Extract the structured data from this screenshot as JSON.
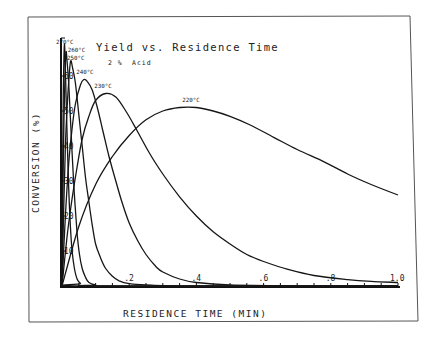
{
  "chart_data": {
    "type": "line",
    "title": "Yield vs. Residence Time",
    "subtitle": "2% Acid",
    "xlabel": "RESIDENCE TIME (MIN)",
    "ylabel": "CONVERSION (%)",
    "xlim": [
      0,
      1.0
    ],
    "ylim": [
      0,
      70
    ],
    "x_ticks": [
      ".2",
      ".4",
      ".6",
      ".8",
      "1.0"
    ],
    "x_tick_values": [
      0.2,
      0.4,
      0.6,
      0.8,
      1.0
    ],
    "y_ticks": [
      "10",
      "20",
      "30",
      "40",
      "50",
      "60"
    ],
    "y_tick_values": [
      10,
      20,
      30,
      40,
      50,
      60
    ],
    "grid": false,
    "legend": "inline curve labels",
    "series": [
      {
        "name": "220°C",
        "label_pos": [
          0.37,
          52.5
        ],
        "points": [
          [
            0,
            0
          ],
          [
            0.05,
            17
          ],
          [
            0.1,
            29
          ],
          [
            0.15,
            37
          ],
          [
            0.2,
            43
          ],
          [
            0.25,
            47.5
          ],
          [
            0.3,
            50
          ],
          [
            0.35,
            51
          ],
          [
            0.4,
            51
          ],
          [
            0.45,
            50
          ],
          [
            0.5,
            48.5
          ],
          [
            0.56,
            46
          ],
          [
            0.63,
            42.5
          ],
          [
            0.7,
            39
          ],
          [
            0.78,
            35.5
          ],
          [
            0.85,
            32
          ],
          [
            0.92,
            29
          ],
          [
            1.0,
            26
          ]
        ]
      },
      {
        "name": "230°C",
        "label_pos": [
          0.12,
          56.5
        ],
        "points": [
          [
            0,
            0
          ],
          [
            0.015,
            14
          ],
          [
            0.03,
            25
          ],
          [
            0.045,
            34
          ],
          [
            0.06,
            42
          ],
          [
            0.08,
            48.5
          ],
          [
            0.1,
            53
          ],
          [
            0.13,
            55
          ],
          [
            0.16,
            54
          ],
          [
            0.19,
            50
          ],
          [
            0.22,
            45
          ],
          [
            0.26,
            38
          ],
          [
            0.3,
            32
          ],
          [
            0.35,
            25.5
          ],
          [
            0.4,
            20
          ],
          [
            0.45,
            15.5
          ],
          [
            0.5,
            12
          ],
          [
            0.55,
            9
          ],
          [
            0.6,
            7
          ],
          [
            0.67,
            4.8
          ],
          [
            0.75,
            3
          ],
          [
            0.85,
            1.8
          ],
          [
            0.92,
            1.3
          ],
          [
            1.0,
            1
          ]
        ]
      },
      {
        "name": "240°C",
        "label_pos": [
          0.06,
          60.5
        ],
        "points": [
          [
            0,
            0
          ],
          [
            0.01,
            20
          ],
          [
            0.02,
            35
          ],
          [
            0.03,
            45
          ],
          [
            0.04,
            52
          ],
          [
            0.055,
            57.5
          ],
          [
            0.065,
            59
          ],
          [
            0.075,
            58.5
          ],
          [
            0.09,
            56
          ],
          [
            0.105,
            51
          ],
          [
            0.12,
            45
          ],
          [
            0.14,
            37
          ],
          [
            0.16,
            30
          ],
          [
            0.18,
            23.5
          ],
          [
            0.2,
            18
          ],
          [
            0.225,
            13
          ],
          [
            0.25,
            9
          ],
          [
            0.28,
            5.5
          ],
          [
            0.3,
            4
          ],
          [
            0.35,
            2
          ],
          [
            0.4,
            1
          ],
          [
            0.5,
            0.3
          ],
          [
            0.7,
            0.05
          ],
          [
            1.0,
            0
          ]
        ]
      },
      {
        "name": "250°C",
        "label_pos": [
          0.015,
          65.5
        ],
        "points": [
          [
            0,
            0
          ],
          [
            0.005,
            22
          ],
          [
            0.01,
            40
          ],
          [
            0.017,
            54
          ],
          [
            0.025,
            64
          ],
          [
            0.032,
            62
          ],
          [
            0.04,
            58
          ],
          [
            0.05,
            49
          ],
          [
            0.06,
            40
          ],
          [
            0.07,
            31
          ],
          [
            0.08,
            24
          ],
          [
            0.09,
            17.5
          ],
          [
            0.1,
            12
          ],
          [
            0.115,
            8
          ],
          [
            0.13,
            5
          ],
          [
            0.15,
            2.8
          ],
          [
            0.17,
            1.5
          ],
          [
            0.2,
            0.7
          ],
          [
            0.25,
            0.3
          ],
          [
            0.4,
            0
          ],
          [
            1.0,
            0
          ]
        ]
      },
      {
        "name": "260°C",
        "label_pos": [
          0.005,
          67.5
        ],
        "points": [
          [
            0,
            0
          ],
          [
            0.003,
            30
          ],
          [
            0.006,
            48
          ],
          [
            0.009,
            60
          ],
          [
            0.012,
            67
          ],
          [
            0.016,
            63
          ],
          [
            0.02,
            58
          ],
          [
            0.025,
            48
          ],
          [
            0.03,
            38
          ],
          [
            0.037,
            26
          ],
          [
            0.045,
            15
          ],
          [
            0.052,
            9
          ],
          [
            0.06,
            5
          ],
          [
            0.07,
            2.5
          ],
          [
            0.08,
            1
          ],
          [
            0.1,
            0.3
          ],
          [
            0.12,
            0
          ],
          [
            1.0,
            0
          ]
        ]
      },
      {
        "name": "270°C",
        "label_pos": [
          0.0,
          69.5
        ],
        "points": [
          [
            0,
            0
          ],
          [
            0.002,
            35
          ],
          [
            0.004,
            55
          ],
          [
            0.007,
            69
          ],
          [
            0.01,
            62
          ],
          [
            0.012,
            55
          ],
          [
            0.016,
            40
          ],
          [
            0.02,
            28
          ],
          [
            0.025,
            17
          ],
          [
            0.03,
            10
          ],
          [
            0.037,
            5
          ],
          [
            0.045,
            2
          ],
          [
            0.055,
            0.7
          ],
          [
            0.07,
            0
          ],
          [
            1.0,
            0
          ]
        ]
      }
    ]
  },
  "labels": {
    "title": "Yield vs. Residence Time",
    "subtitle_pct": "2 %",
    "subtitle_acid": "Acid",
    "xlabel": "RESIDENCE TIME (MIN)",
    "ylabel": "CONVERSION (%)",
    "x_ticks": [
      ".2",
      ".4",
      ".6",
      ".8",
      "1.0"
    ],
    "y_ticks": [
      "10",
      "20",
      "30",
      "40",
      "50",
      "60"
    ],
    "curve_labels": [
      "220°C",
      "230°C",
      "240°C",
      "250°C",
      "260°C",
      "270°C"
    ]
  }
}
